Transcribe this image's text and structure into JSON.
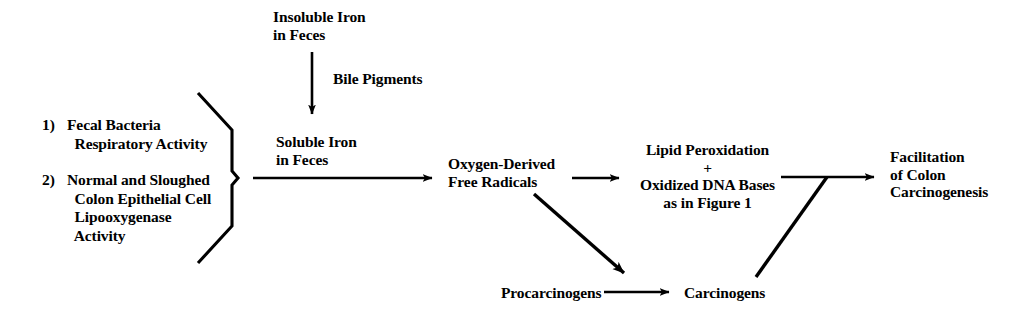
{
  "diagram": {
    "ink_color": "#000000",
    "background_color": "#ffffff",
    "sources": {
      "list": [
        {
          "marker": "1)",
          "lines": "Fecal Bacteria\n  Respiratory Activity"
        },
        {
          "marker": "2)",
          "lines": "Normal and Sloughed\n  Colon Epithelial Cell\n  Lipooxygenase\n  Activity"
        }
      ]
    },
    "nodes": {
      "insoluble_iron": "Insoluble Iron\nin Feces",
      "bile_pigments": "Bile Pigments",
      "soluble_iron": "Soluble Iron\nin Feces",
      "free_radicals": "Oxygen-Derived\nFree Radicals",
      "lipid_peroxidation": "Lipid Peroxidation\n+\nOxidized DNA Bases\nas in Figure 1",
      "facilitation": "Facilitation\nof Colon\nCarcinogenesis",
      "procarcinogens": "Procarcinogens",
      "carcinogens": "Carcinogens"
    },
    "edges": [
      {
        "name": "insoluble-to-soluble",
        "label": "Bile Pigments",
        "style": "arrow-down"
      },
      {
        "name": "sources-to-free-radicals",
        "label": "",
        "style": "arrow-right"
      },
      {
        "name": "free-radicals-to-lipid-peroxidation",
        "label": "",
        "style": "arrow-right"
      },
      {
        "name": "free-radicals-to-carcinogens",
        "label": "",
        "style": "arrow-diagonal-down-right"
      },
      {
        "name": "procarcinogens-to-carcinogens",
        "label": "",
        "style": "arrow-right"
      },
      {
        "name": "lipid-peroxidation-to-facilitation",
        "label": "",
        "style": "arrow-right"
      },
      {
        "name": "carcinogens-to-facilitation",
        "label": "",
        "style": "line-diagonal-up-right"
      }
    ]
  }
}
